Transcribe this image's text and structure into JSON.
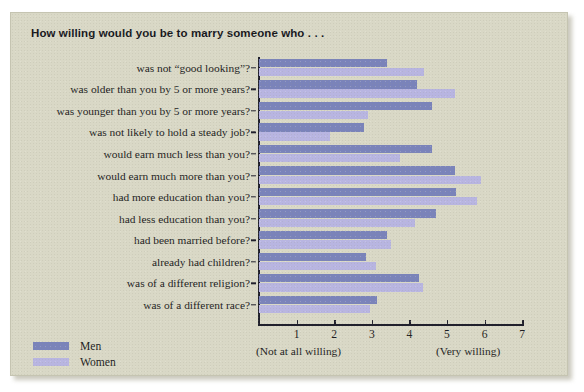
{
  "title": "How willing would you be to marry someone who . . .",
  "axis": {
    "left_note": "(Not at all willing)",
    "right_note": "(Very willing)",
    "ticks": [
      "1",
      "2",
      "3",
      "4",
      "5",
      "6",
      "7"
    ]
  },
  "legend": {
    "items": [
      {
        "label": "Men",
        "color": "#7a83ba"
      },
      {
        "label": "Women",
        "color": "#b8b5e1"
      }
    ]
  },
  "chart_data": {
    "type": "bar",
    "orientation": "horizontal",
    "title": "How willing would you be to marry someone who . . .",
    "xlabel": "",
    "ylabel": "",
    "xlim": [
      0,
      7
    ],
    "xticks": [
      1,
      2,
      3,
      4,
      5,
      6,
      7
    ],
    "xtick_labels": [
      "1",
      "2",
      "3",
      "4",
      "5",
      "6",
      "7"
    ],
    "x_axis_endpoints": [
      "(Not at all willing)",
      "(Very willing)"
    ],
    "grid": false,
    "legend_position": "bottom-left",
    "categories": [
      "was not “good looking”?",
      "was older than you by 5 or more years?",
      "was younger than you by 5 or more years?",
      "was not likely to hold a steady job?",
      "would earn much less than you?",
      "would earn much more than you?",
      "had more education than you?",
      "had less education than you?",
      "had been married before?",
      "already had children?",
      "was of a different religion?",
      "was of a different race?"
    ],
    "series": [
      {
        "name": "Men",
        "color": "#7a83ba",
        "values": [
          3.4,
          4.2,
          4.6,
          2.8,
          4.6,
          5.2,
          5.25,
          4.7,
          3.4,
          2.85,
          4.25,
          3.15
        ]
      },
      {
        "name": "Women",
        "color": "#b8b5e1",
        "values": [
          4.4,
          5.2,
          2.9,
          1.9,
          3.75,
          5.9,
          5.8,
          4.15,
          3.5,
          3.1,
          4.35,
          2.95
        ]
      }
    ]
  }
}
